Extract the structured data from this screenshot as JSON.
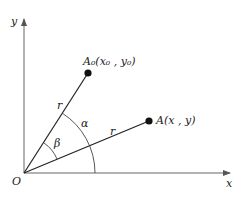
{
  "diagram": {
    "type": "rotation-of-point-about-origin",
    "axes": {
      "x_label": "x",
      "y_label": "y",
      "origin_label": "O"
    },
    "points": [
      {
        "id": "A0",
        "label": "A₀(x₀ , y₀)",
        "pos": [
          88,
          73
        ]
      },
      {
        "id": "A",
        "label": "A(x , y)",
        "pos": [
          149,
          121
        ]
      }
    ],
    "segments": [
      {
        "from": "O",
        "to": "A0",
        "label": "r"
      },
      {
        "from": "O",
        "to": "A",
        "label": "r"
      }
    ],
    "angles": [
      {
        "label": "β",
        "between": [
          "OA",
          "OA0"
        ]
      },
      {
        "label": "α",
        "between": [
          "x-axis",
          "OA0"
        ]
      }
    ],
    "colors": {
      "line": "#222222",
      "point": "#111111",
      "axis": "#555555"
    }
  }
}
